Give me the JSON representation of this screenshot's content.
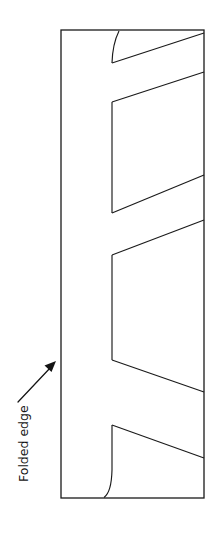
{
  "figure": {
    "type": "technical-illustration",
    "background_color": "#ffffff",
    "line_color": "#1a1a1a",
    "canvas": {
      "width": 218,
      "height": 533
    }
  },
  "annotations": {
    "folded_edge": {
      "label": "Folded edge",
      "rotation_degrees": -90,
      "text_color": "#141414",
      "arrow": {
        "name": "folded-edge-arrow",
        "from_x": 18,
        "from_y": 402,
        "to_x": 55,
        "to_y": 363,
        "color": "#141414"
      }
    }
  },
  "panel": {
    "name": "folded-panel",
    "left": 61,
    "top": 30,
    "right": 204,
    "bottom": 498,
    "width": 143,
    "height": 468,
    "outline_color": "#1a1a1a",
    "fill_color": "#ffffff"
  },
  "fold_geometry": {
    "left_crease_x": 112,
    "right_edge_x": 204,
    "top_curve": {
      "name": "top-rounded-fold",
      "start_x": 119,
      "start_y": 31,
      "end_x": 112,
      "end_y": 63
    },
    "bottom_curve": {
      "name": "bottom-rounded-fold",
      "start_x": 112,
      "start_y": 425,
      "end_x": 104,
      "end_y": 497
    },
    "diagonals": [
      {
        "name": "fold-diagonal-1",
        "x1": 112,
        "y1": 63,
        "x2": 204,
        "y2": 33
      },
      {
        "name": "fold-diagonal-2",
        "x1": 204,
        "y1": 72,
        "x2": 112,
        "y2": 102
      },
      {
        "name": "fold-diagonal-3",
        "x1": 112,
        "y1": 213,
        "x2": 204,
        "y2": 175
      },
      {
        "name": "fold-diagonal-4",
        "x1": 204,
        "y1": 220,
        "x2": 112,
        "y2": 255
      },
      {
        "name": "fold-diagonal-5",
        "x1": 112,
        "y1": 360,
        "x2": 204,
        "y2": 392
      },
      {
        "name": "fold-diagonal-6",
        "x1": 112,
        "y1": 425,
        "x2": 204,
        "y2": 458
      }
    ],
    "verticals": [
      {
        "name": "crease-vertical-upper",
        "x": 112,
        "y1": 102,
        "y2": 213
      },
      {
        "name": "crease-vertical-lower",
        "x": 112,
        "y1": 255,
        "y2": 360
      }
    ]
  }
}
